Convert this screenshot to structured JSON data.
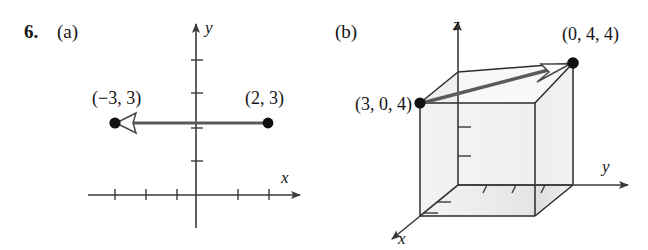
{
  "figure": {
    "problem_number": "6.",
    "parts": [
      {
        "id": "a",
        "label": "(a)",
        "type": "2d-vector-plot",
        "axis_labels": {
          "x": "x",
          "y": "y"
        },
        "points": [
          {
            "name": "tail-point",
            "label": "(2, 3)",
            "coords": [
              2,
              3
            ]
          },
          {
            "name": "head-point",
            "label": "(−3, 3)",
            "coords": [
              -3,
              3
            ]
          }
        ],
        "vector": {
          "from_label": "(2, 3)",
          "to_label": "(−3, 3)",
          "arrowhead": "open-triangle-left"
        }
      },
      {
        "id": "b",
        "label": "(b)",
        "type": "3d-vector-box-plot",
        "axis_labels": {
          "x": "x",
          "y": "y",
          "z": "z"
        },
        "points": [
          {
            "name": "tail-point",
            "label": "(3, 0, 4)",
            "coords": [
              3,
              0,
              4
            ]
          },
          {
            "name": "head-point",
            "label": "(0, 4, 4)",
            "coords": [
              0,
              4,
              4
            ]
          }
        ],
        "vector": {
          "from_label": "(3, 0, 4)",
          "to_label": "(0, 4, 4)",
          "arrowhead": "open-triangle-right"
        }
      }
    ]
  },
  "colors": {
    "ink": "#141414",
    "axis": "#3a3a3a",
    "vector": "#5a5a5a",
    "box_edge": "#2b2b2b",
    "box_face_light": "#f1f1f1",
    "box_face_mid": "#e6e6e6",
    "background": "#ffffff"
  }
}
